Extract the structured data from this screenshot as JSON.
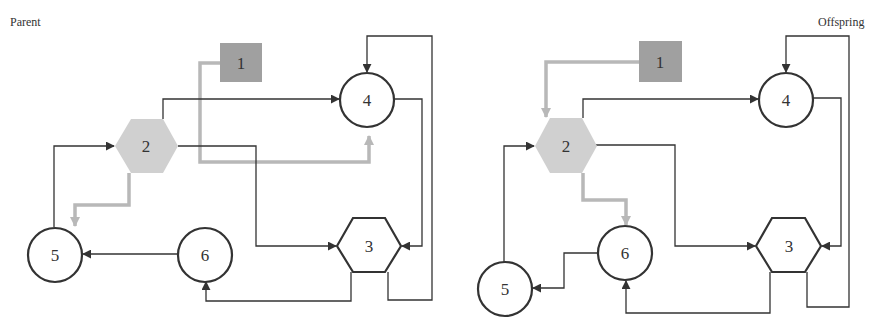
{
  "diagrams": [
    {
      "title": "Parent",
      "nodes": [
        {
          "id": "1",
          "label": "1",
          "shape": "square",
          "fill": "#a0a0a0"
        },
        {
          "id": "2",
          "label": "2",
          "shape": "hexagon",
          "fill": "#d0d0d0"
        },
        {
          "id": "3",
          "label": "3",
          "shape": "hexagon",
          "fill": "#ffffff"
        },
        {
          "id": "4",
          "label": "4",
          "shape": "circle",
          "fill": "#ffffff"
        },
        {
          "id": "5",
          "label": "5",
          "shape": "circle",
          "fill": "#ffffff"
        },
        {
          "id": "6",
          "label": "6",
          "shape": "circle",
          "fill": "#ffffff"
        }
      ],
      "edges": [
        {
          "from": "1",
          "to": "4",
          "highlight": true
        },
        {
          "from": "2",
          "to": "5",
          "highlight": true
        },
        {
          "from": "2",
          "to": "4",
          "highlight": false
        },
        {
          "from": "2",
          "to": "3",
          "highlight": false
        },
        {
          "from": "5",
          "to": "2",
          "highlight": false
        },
        {
          "from": "6",
          "to": "5",
          "highlight": false
        },
        {
          "from": "4",
          "to": "3",
          "highlight": false
        },
        {
          "from": "3",
          "to": "6",
          "highlight": false
        },
        {
          "from": "3",
          "to": "4",
          "highlight": false
        }
      ]
    },
    {
      "title": "Offspring",
      "nodes": [
        {
          "id": "1",
          "label": "1",
          "shape": "square",
          "fill": "#a0a0a0"
        },
        {
          "id": "2",
          "label": "2",
          "shape": "hexagon",
          "fill": "#d0d0d0"
        },
        {
          "id": "3",
          "label": "3",
          "shape": "hexagon",
          "fill": "#ffffff"
        },
        {
          "id": "4",
          "label": "4",
          "shape": "circle",
          "fill": "#ffffff"
        },
        {
          "id": "5",
          "label": "5",
          "shape": "circle",
          "fill": "#ffffff"
        },
        {
          "id": "6",
          "label": "6",
          "shape": "circle",
          "fill": "#ffffff"
        }
      ],
      "edges": [
        {
          "from": "1",
          "to": "2",
          "highlight": true
        },
        {
          "from": "2",
          "to": "6",
          "highlight": true
        },
        {
          "from": "2",
          "to": "4",
          "highlight": false
        },
        {
          "from": "2",
          "to": "3",
          "highlight": false
        },
        {
          "from": "5",
          "to": "2",
          "highlight": false
        },
        {
          "from": "6",
          "to": "5",
          "highlight": false
        },
        {
          "from": "4",
          "to": "3",
          "highlight": false
        },
        {
          "from": "3",
          "to": "6",
          "highlight": false
        },
        {
          "from": "3",
          "to": "4",
          "highlight": false
        }
      ]
    }
  ],
  "colors": {
    "edge": "#333333",
    "highlight_edge": "#b8b8b8",
    "input_node": "#a0a0a0",
    "mutated_node": "#d0d0d0"
  }
}
